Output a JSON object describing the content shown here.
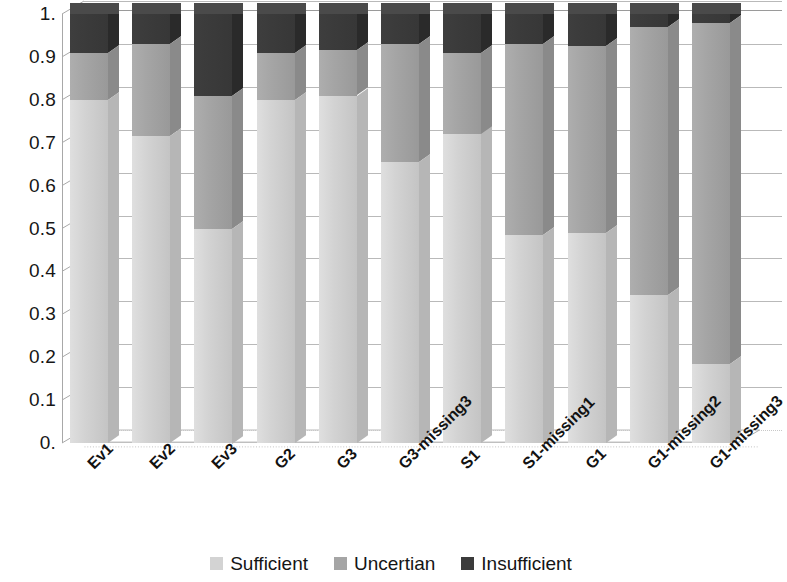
{
  "chart_data": {
    "type": "bar",
    "subtype": "stacked-100-percent-3d",
    "title": "",
    "xlabel": "",
    "ylabel": "",
    "ylim": [
      0,
      1
    ],
    "grid": true,
    "legend_position": "bottom-center",
    "y_ticks": [
      "0.",
      "0.1",
      "0.2",
      "0.3",
      "0.4",
      "0.5",
      "0.6",
      "0.7",
      "0.8",
      "0.9",
      "1."
    ],
    "y_tick_values": [
      0,
      0.1,
      0.2,
      0.3,
      0.4,
      0.5,
      0.6,
      0.7,
      0.8,
      0.9,
      1.0
    ],
    "categories": [
      "Ev1",
      "Ev2",
      "Ev3",
      "G2",
      "G3",
      "G3-missing3",
      "S1",
      "S1-missing1",
      "G1",
      "G1-missing2",
      "G1-missing3"
    ],
    "series": [
      {
        "name": "Sufficient",
        "color": "#d3d3d3",
        "side_color": "#b6b6b6",
        "top_color": "#dedede",
        "values": [
          0.8,
          0.715,
          0.5,
          0.8,
          0.81,
          0.655,
          0.72,
          0.485,
          0.49,
          0.345,
          0.185
        ]
      },
      {
        "name": "Uncertian",
        "color": "#a5a5a5",
        "side_color": "#8a8a8a",
        "top_color": "#b2b2b2",
        "values": [
          0.11,
          0.215,
          0.31,
          0.11,
          0.105,
          0.275,
          0.19,
          0.445,
          0.435,
          0.625,
          0.795
        ]
      },
      {
        "name": "Insufficient",
        "color": "#3b3b3b",
        "side_color": "#2a2a2a",
        "top_color": "#4a4a4a",
        "values": [
          0.09,
          0.07,
          0.19,
          0.09,
          0.085,
          0.07,
          0.09,
          0.07,
          0.075,
          0.03,
          0.02
        ]
      }
    ]
  },
  "legend": {
    "items": [
      {
        "label": "Sufficient",
        "color": "#d3d3d3"
      },
      {
        "label": "Uncertian",
        "color": "#a5a5a5"
      },
      {
        "label": "Insufficient",
        "color": "#3b3b3b"
      }
    ]
  }
}
